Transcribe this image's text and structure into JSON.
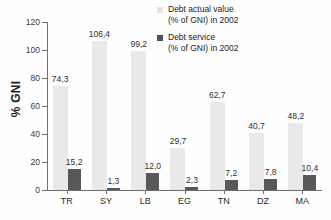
{
  "chart_data": {
    "type": "bar",
    "title": "",
    "xlabel": "",
    "ylabel": "% GNI",
    "ylim": [
      0,
      120
    ],
    "yticks": [
      0,
      20,
      40,
      60,
      80,
      100,
      120
    ],
    "grid": false,
    "legend_position": "top-right inside plot",
    "decimal_separator": ",",
    "categories": [
      "TR",
      "SY",
      "LB",
      "EG",
      "TN",
      "DZ",
      "MA"
    ],
    "series": [
      {
        "name": "Debt actual value (% of GNI) in 2002",
        "color": "#e9e9e9",
        "values": [
          74.3,
          106.4,
          99.2,
          29.7,
          62.7,
          40.7,
          48.2
        ],
        "labels": [
          "74,3",
          "106,4",
          "99,2",
          "29,7",
          "62,7",
          "40,7",
          "48,2"
        ]
      },
      {
        "name": "Debt service (% of GNI) in 2002",
        "color": "#585858",
        "values": [
          15.2,
          1.3,
          12.0,
          2.3,
          7.2,
          7.8,
          10.4
        ],
        "labels": [
          "15,2",
          "1,3",
          "12,0",
          "2,3",
          "7,2",
          "7,8",
          "10,4"
        ]
      }
    ]
  },
  "axis": {
    "y_label": "% GNI",
    "y_tick_labels": [
      "0",
      "20",
      "40",
      "60",
      "80",
      "100",
      "120"
    ]
  },
  "legend": {
    "entries": [
      {
        "line1": "Debt actual value",
        "line2": "(% of GNI) in 2002",
        "swatch": "light-gray-square"
      },
      {
        "line1": "Debt service",
        "line2": "(% of GNI) in 2002",
        "swatch": "dark-gray-square"
      }
    ]
  }
}
